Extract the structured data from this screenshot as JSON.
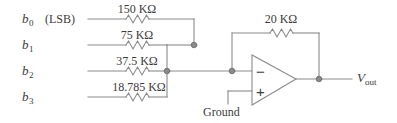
{
  "figure": {
    "wire_color": "#8a8a8a",
    "text_color": "#3b3b3b",
    "background": "#ffffff"
  },
  "inputs": [
    {
      "bit": "b",
      "index": "0",
      "note": "(LSB)",
      "resistor": "150 KΩ"
    },
    {
      "bit": "b",
      "index": "1",
      "note": "",
      "resistor": "75 KΩ"
    },
    {
      "bit": "b",
      "index": "2",
      "note": "",
      "resistor": "37.5 KΩ"
    },
    {
      "bit": "b",
      "index": "3",
      "note": "",
      "resistor": "18.785 KΩ"
    }
  ],
  "feedback": {
    "resistor": "20 KΩ"
  },
  "opamp": {
    "inverting_sign": "−",
    "noninverting_sign": "+",
    "ground_label": "Ground"
  },
  "output": {
    "symbol": "V",
    "subscript": "out"
  }
}
